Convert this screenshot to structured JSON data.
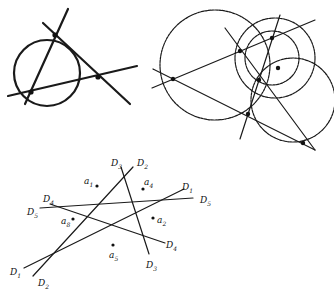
{
  "figures": {
    "figure_1": {
      "description": "Circle through three intersection points of three lines (circumscribed triangle)",
      "circle": {
        "cx": 47,
        "cy": 73,
        "r": 33
      },
      "lines": [
        {
          "x1": 25,
          "y1": 104,
          "x2": 68,
          "y2": 9
        },
        {
          "x1": 43,
          "y1": 23,
          "x2": 130,
          "y2": 104
        },
        {
          "x1": 8,
          "y1": 96,
          "x2": 137,
          "y2": 66
        }
      ],
      "points": [
        {
          "x": 55,
          "y": 35
        },
        {
          "x": 98,
          "y": 77
        },
        {
          "x": 31,
          "y": 92
        }
      ]
    },
    "figure_2": {
      "description": "Four lines with circumcircles of the triangles meeting at a common point",
      "circles": [
        {
          "cx": 215,
          "cy": 65,
          "r": 55
        },
        {
          "cx": 275,
          "cy": 58,
          "r": 40
        },
        {
          "cx": 272,
          "cy": 58,
          "r": 27
        },
        {
          "cx": 293,
          "cy": 100,
          "r": 42
        }
      ],
      "lines": [
        {
          "x1": 152,
          "y1": 88,
          "x2": 315,
          "y2": 20
        },
        {
          "x1": 153,
          "y1": 69,
          "x2": 315,
          "y2": 150
        },
        {
          "x1": 225,
          "y1": 28,
          "x2": 315,
          "y2": 150
        },
        {
          "x1": 240,
          "y1": 139,
          "x2": 280,
          "y2": 15
        }
      ],
      "points": [
        {
          "x": 173,
          "y": 79
        },
        {
          "x": 240,
          "y": 51
        },
        {
          "x": 272,
          "y": 38
        },
        {
          "x": 259,
          "y": 80
        },
        {
          "x": 278,
          "y": 68
        },
        {
          "x": 248,
          "y": 114
        },
        {
          "x": 303,
          "y": 143
        }
      ]
    },
    "figure_3": {
      "description": "Five lines D1-D5 forming cells, with points a1, a2, a4, a5, a8 marked",
      "lines": [
        {
          "id": "D1",
          "x1": 24,
          "y1": 268,
          "x2": 184,
          "y2": 189
        },
        {
          "id": "D2",
          "x1": 33,
          "y1": 276,
          "x2": 133,
          "y2": 167
        },
        {
          "id": "D3",
          "x1": 121,
          "y1": 167,
          "x2": 149,
          "y2": 254
        },
        {
          "id": "D4",
          "x1": 50,
          "y1": 204,
          "x2": 165,
          "y2": 243
        },
        {
          "id": "D5",
          "x1": 40,
          "y1": 208,
          "x2": 193,
          "y2": 198
        }
      ],
      "line_labels": [
        {
          "text": "D",
          "sub": "1",
          "x": 182,
          "y": 190
        },
        {
          "text": "D",
          "sub": "5",
          "x": 200,
          "y": 203
        },
        {
          "text": "D",
          "sub": "2",
          "x": 137,
          "y": 166
        },
        {
          "text": "D",
          "sub": "3",
          "x": 111,
          "y": 166
        },
        {
          "text": "D",
          "sub": "4",
          "x": 166,
          "y": 248
        },
        {
          "text": "D",
          "sub": "3",
          "x": 146,
          "y": 268
        },
        {
          "text": "D",
          "sub": "4",
          "x": 43,
          "y": 202
        },
        {
          "text": "D",
          "sub": "5",
          "x": 27,
          "y": 215
        },
        {
          "text": "D",
          "sub": "1",
          "x": 10,
          "y": 275
        },
        {
          "text": "D",
          "sub": "2",
          "x": 38,
          "y": 286
        }
      ],
      "points": [
        {
          "label": "a",
          "sub": "1",
          "x": 97,
          "y": 186,
          "lx": 84,
          "ly": 184
        },
        {
          "label": "a",
          "sub": "4",
          "x": 143,
          "y": 189,
          "lx": 144,
          "ly": 185
        },
        {
          "label": "a",
          "sub": "8",
          "x": 73,
          "y": 219,
          "lx": 61,
          "ly": 224
        },
        {
          "label": "a",
          "sub": "2",
          "x": 153,
          "y": 218,
          "lx": 157,
          "ly": 223
        },
        {
          "label": "a",
          "sub": "5",
          "x": 113,
          "y": 245,
          "lx": 109,
          "ly": 258
        }
      ]
    }
  }
}
